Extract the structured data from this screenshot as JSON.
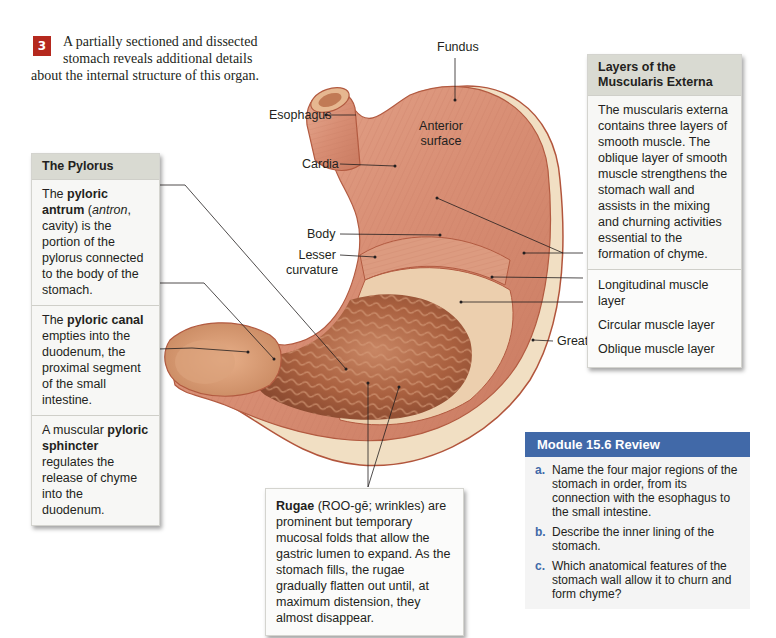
{
  "intro": {
    "step_number": "3",
    "text": "A partially sectioned and dissected stomach reveals additional details about the internal structure of this organ.",
    "line1": "A partially sectioned and dissected",
    "line2": "stomach reveals additional details",
    "line3": "about the internal structure of this organ."
  },
  "diagram_labels": {
    "fundus": "Fundus",
    "esophagus": "Esophagus",
    "anterior_surface_1": "Anterior",
    "anterior_surface_2": "surface",
    "cardia": "Cardia",
    "body": "Body",
    "lesser_curvature_1": "Lesser",
    "lesser_curvature_2": "curvature",
    "greater_curvature": "Greater curvature"
  },
  "pylorus_box": {
    "title": "The Pylorus",
    "sections": [
      {
        "pre": "The ",
        "bold": "pyloric antrum",
        "italic": "antron",
        "rest1": "(",
        "rest2": ", cavity) is the portion of the pylorus connected to the body of the stomach."
      },
      {
        "pre": "The ",
        "bold": "pyloric canal",
        "rest": " empties into the duodenum, the proximal segment of the small intestine."
      },
      {
        "pre": "A muscular ",
        "bold": "pyloric sphincter",
        "rest": " regulates the release of chyme into the duodenum."
      }
    ]
  },
  "muscularis_box": {
    "title": "Layers of the Muscularis Externa",
    "description": "The muscularis externa contains three layers of smooth muscle. The oblique layer of smooth muscle strengthens the stomach wall and assists in the mixing and churning activities essential to the formation of chyme.",
    "layers": [
      "Longitudinal muscle layer",
      "Circular muscle layer",
      "Oblique muscle layer"
    ]
  },
  "rugae_box": {
    "bold": "Rugae",
    "rest": " (ROO-gē; wrinkles) are prominent but temporary mucosal folds that allow the gastric lumen to expand. As the stomach fills, the rugae gradually flatten out until, at maximum distension, they almost disappear."
  },
  "review": {
    "title": "Module 15.6 Review",
    "items": [
      {
        "label": "a.",
        "text": "Name the four major regions of the stomach in order, from its connection with the esophagus to the small intestine."
      },
      {
        "label": "b.",
        "text": "Describe the inner lining of the stomach."
      },
      {
        "label": "c.",
        "text": "Which anatomical features of the stomach wall allow it to churn and form chyme?"
      }
    ]
  },
  "colors": {
    "step_badge": "#b5291e",
    "review_header": "#4169a8",
    "box_header": "#d9dad2",
    "muscle": "#d9957c",
    "serosa": "#f0dcc0",
    "mucosa": "#b86f4f"
  }
}
